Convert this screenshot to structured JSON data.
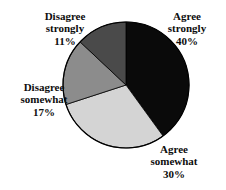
{
  "chart_data": {
    "type": "pie",
    "title": "",
    "subtitle": "",
    "xlabel": "",
    "ylabel": "",
    "grid": false,
    "legend_position": "none",
    "labels_inline": true,
    "start_angle_deg": 0,
    "direction": "clockwise",
    "categories": [
      "Agree strongly",
      "Agree somewhat",
      "Disagree somewhat",
      "Disagree strongly"
    ],
    "values": [
      40,
      30,
      17,
      11
    ],
    "value_unit": "%",
    "colors": [
      "#0a0a0a",
      "#d4d4d4",
      "#8c8c8c",
      "#4a4a4a"
    ],
    "slices": [
      {
        "name": "Agree strongly",
        "label_line1": "Agree",
        "label_line2": "strongly",
        "value": 40,
        "value_text": "40%",
        "color": "#0a0a0a",
        "start_deg": 0,
        "end_deg": 144
      },
      {
        "name": "Agree somewhat",
        "label_line1": "Agree",
        "label_line2": "somewhat",
        "value": 30,
        "value_text": "30%",
        "color": "#d4d4d4",
        "start_deg": 144,
        "end_deg": 252
      },
      {
        "name": "Disagree somewhat",
        "label_line1": "Disagree",
        "label_line2": "somewhat",
        "value": 17,
        "value_text": "17%",
        "color": "#8c8c8c",
        "start_deg": 252,
        "end_deg": 313.2
      },
      {
        "name": "Disagree strongly",
        "label_line1": "Disagree",
        "label_line2": "strongly",
        "value": 11,
        "value_text": "11%",
        "color": "#4a4a4a",
        "start_deg": 313.2,
        "end_deg": 360
      }
    ],
    "geometry": {
      "center_x": 126,
      "center_y": 85,
      "radius": 63,
      "outline_color": "#000000"
    }
  }
}
